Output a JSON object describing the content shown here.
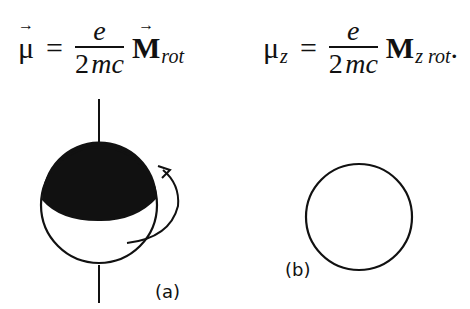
{
  "equations": {
    "eq1": {
      "lhs_symbol": "μ",
      "lhs_vector_arrow": "→",
      "equals": "=",
      "numerator": "e",
      "denominator_number": "2",
      "denominator_vars": "mc",
      "rhs_symbol": "M",
      "rhs_vector_arrow": "→",
      "rhs_subscript": "rot"
    },
    "eq2": {
      "lhs_symbol": "μ",
      "lhs_subscript": "z",
      "equals": "=",
      "numerator": "e",
      "denominator_number": "2",
      "denominator_vars": "mc",
      "rhs_symbol": "M",
      "rhs_subscript": "z rot",
      "trailing": "."
    }
  },
  "figure": {
    "panel_a": {
      "label": "(a)",
      "description": "sphere with shaded upper cap, vertical rotation axis, curved rotation arrow"
    },
    "panel_b": {
      "label": "(b)",
      "description": "plain circle"
    },
    "colors": {
      "ink": "#111111",
      "background": "#ffffff"
    }
  }
}
